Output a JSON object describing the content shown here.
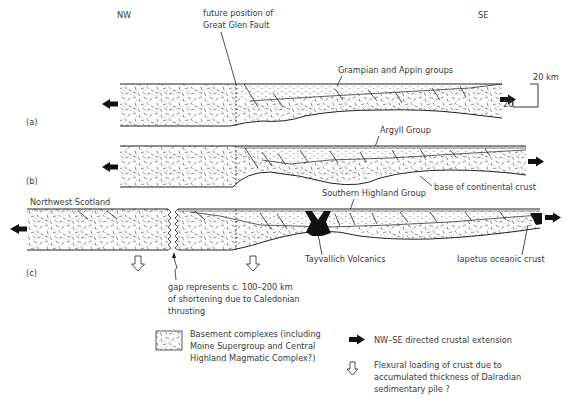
{
  "orientation": {
    "left": "NW",
    "right": "SE"
  },
  "panels": [
    {
      "id": "a",
      "label": "(a)"
    },
    {
      "id": "b",
      "label": "(b)"
    },
    {
      "id": "c",
      "label": "(c)"
    }
  ],
  "annotations": {
    "great_glen_1": "future position of",
    "great_glen_2": "Great Glen Fault",
    "grampian_appin": "Grampian and Appin groups",
    "argyll": "Argyll Group",
    "base_crust": "base of continental crust",
    "southern_highland": "Southern Highland Group",
    "northwest_scotland": "Northwest Scotland",
    "tayvallich": "Tayvallich Volcanics",
    "iapetus": "Iapetus oceanic crust",
    "gap_1": "gap represents c. 100–200 km",
    "gap_2": "of shortening due to Caledonian",
    "gap_3": "thrusting"
  },
  "scale_bar": {
    "vertical": "20 km",
    "horizontal": "20"
  },
  "legend": {
    "basement_1": "Basement complexes (including",
    "basement_2": "Moine Supergroup and Central",
    "basement_3": "Highland Magmatic Complex?)",
    "extension": "NW–SE directed crustal extension",
    "flexural_1": "Flexural loading of crust due to",
    "flexural_2": "accumulated thickness of Dalradian",
    "flexural_3": "sedimentary pile ?"
  }
}
